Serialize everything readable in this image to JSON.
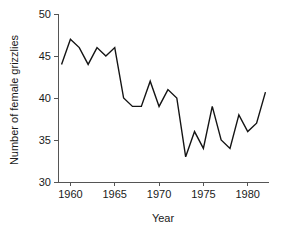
{
  "chart_data": {
    "type": "line",
    "title": "",
    "subtitle": "",
    "xlabel": "Year",
    "ylabel": "Number of female grizzlies",
    "xlim": [
      1958.6,
      1982.4
    ],
    "ylim": [
      30,
      50
    ],
    "grid": false,
    "legend": null,
    "line_color": "#141414",
    "axis_color": "#555555",
    "background_color": "#ffffff",
    "x_ticks": [
      1960,
      1965,
      1970,
      1975,
      1980
    ],
    "x_tick_labels": [
      "1960",
      "1965",
      "1970",
      "1975",
      "1980"
    ],
    "y_ticks": [
      30,
      35,
      40,
      45,
      50
    ],
    "y_tick_labels": [
      "30",
      "35",
      "40",
      "45",
      "50"
    ],
    "x": [
      1959,
      1960,
      1961,
      1962,
      1963,
      1964,
      1965,
      1966,
      1967,
      1968,
      1969,
      1970,
      1971,
      1972,
      1973,
      1974,
      1975,
      1976,
      1977,
      1978,
      1979,
      1980,
      1981,
      1982
    ],
    "values": [
      44,
      47,
      46,
      44,
      46,
      45,
      46,
      40,
      39,
      39,
      42,
      39,
      41,
      40,
      33,
      36,
      34,
      39,
      35,
      34,
      38,
      36,
      37,
      40.7
    ],
    "series": [
      {
        "name": "Number of female grizzlies",
        "values": [
          44,
          47,
          46,
          44,
          46,
          45,
          46,
          40,
          39,
          39,
          42,
          39,
          41,
          40,
          33,
          36,
          34,
          39,
          35,
          34,
          38,
          36,
          37,
          40.7
        ]
      }
    ]
  }
}
